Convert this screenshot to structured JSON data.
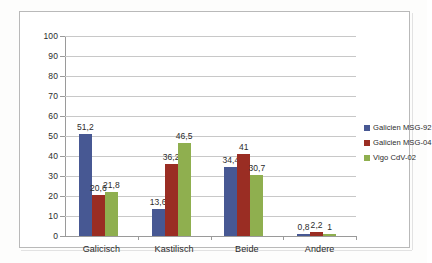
{
  "chart_data": {
    "type": "bar",
    "title": "",
    "subtitle": "",
    "xlabel": "",
    "ylabel": "",
    "ylim": [
      0,
      100
    ],
    "ytick_step": 10,
    "yticks": [
      "100",
      "90",
      "80",
      "70",
      "60",
      "50",
      "40",
      "30",
      "20",
      "10",
      "0"
    ],
    "grid": true,
    "grid_axis": "y",
    "legend_position": "right",
    "decimal_separator": ",",
    "categories": [
      "Galicisch",
      "Kastilisch",
      "Beide",
      "Andere"
    ],
    "series": [
      {
        "name": "Galicien MSG-92",
        "color": "#475893",
        "values": [
          51.2,
          13.6,
          34.4,
          0.8
        ],
        "labels": [
          "51,2",
          "13,6",
          "34,4",
          "0,8"
        ]
      },
      {
        "name": "Galicien MSG-04",
        "color": "#9a2d23",
        "values": [
          20.6,
          36.2,
          41,
          2.2
        ],
        "labels": [
          "20,6",
          "36,2",
          "41",
          "2,2"
        ]
      },
      {
        "name": "Vigo CdV-02",
        "color": "#8faf4f",
        "values": [
          21.8,
          46.5,
          30.7,
          1
        ],
        "labels": [
          "21,8",
          "46,5",
          "30,7",
          "1"
        ]
      }
    ]
  },
  "colors": {
    "series_1": "#475893",
    "series_2": "#9a2d23",
    "series_3": "#8faf4f",
    "gridline": "#c8c8c8",
    "axis": "#9a9a9a",
    "frame": "#b9b9b9",
    "text": "#2b2b2b",
    "background": "#ffffff"
  }
}
